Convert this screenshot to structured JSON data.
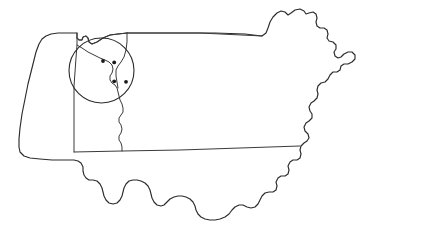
{
  "figure": {
    "name": "massachusetts-county-map-with-study-area",
    "width": 437,
    "height": 246,
    "background_color": "#ffffff",
    "outline_color": "#2b2b2b",
    "county_line_color": "#3a3a3a",
    "marker_color": "#1a1a1a",
    "title": "",
    "caption": "",
    "labels": []
  },
  "map": {
    "region_name": "Massachusetts",
    "projection_note": "simple outline, no graticule",
    "state_outline_path": "M 19 139 L 20 128 L 22 114 L 25 99 L 28 84 L 32 68 L 36 52 L 39 44 L 42 39 L 46 36 L 51 34 L 58 33 L 68 33 L 77 33 L 77 38 L 79 40 L 82 40 L 83 37 L 86 36 L 88 38 L 89 42 L 92 44 L 97 42 L 103 38 L 110 35 L 118 34 L 127 33 L 140 33 L 160 33 L 185 33 L 215 33 L 245 34 L 262 36 L 266 33 L 268 28 L 270 22 L 273 17 L 277 13 L 281 11 L 285 12 L 288 15 L 291 13 L 295 10 L 300 9 L 304 11 L 306 14 L 309 13 L 313 12 L 316 14 L 317 18 L 316 22 L 317 26 L 320 28 L 324 28 L 327 30 L 328 34 L 327 38 L 329 41 L 333 42 L 336 45 L 336 49 L 334 52 L 335 56 L 338 58 L 341 57 L 344 54 L 348 52 L 352 52 L 355 55 L 355 59 L 352 62 L 348 64 L 344 64 L 341 66 L 340 70 L 337 72 L 333 72 L 330 75 L 328 79 L 325 82 L 321 83 L 318 86 L 317 90 L 318 94 L 317 98 L 314 101 L 311 103 L 309 107 L 310 111 L 312 114 L 312 118 L 309 121 L 306 123 L 304 127 L 305 131 L 308 134 L 309 138 L 307 141 L 304 143 L 301 146 L 300 150 L 301 154 L 300 158 L 297 160 L 293 160 L 290 162 L 288 166 L 289 170 L 288 174 L 285 176 L 281 176 L 278 178 L 276 182 L 277 186 L 276 190 L 273 192 L 269 192 L 265 193 L 262 196 L 260 200 L 258 204 L 255 207 L 251 208 L 247 207 L 243 205 L 239 205 L 235 207 L 232 210 L 229 214 L 225 217 L 220 219 L 215 220 L 210 220 L 205 219 L 201 217 L 198 214 L 196 210 L 195 206 L 193 202 L 190 199 L 186 197 L 182 196 L 178 196 L 174 197 L 170 199 L 167 202 L 164 205 L 161 206 L 157 205 L 154 202 L 152 198 L 151 194 L 150 190 L 148 186 L 145 183 L 141 181 L 137 180 L 133 180 L 129 181 L 126 184 L 124 188 L 123 192 L 122 196 L 120 200 L 117 203 L 113 204 L 109 203 L 106 200 L 104 196 L 103 192 L 102 188 L 100 184 L 97 181 L 93 180 L 89 180 L 86 178 L 84 175 L 83 171 L 83 167 L 81 163 L 78 161 L 74 160 L 70 160 L 62 160 L 52 160 L 40 159 L 30 158 L 24 156 L 20 152 L 19 147 Z",
    "county_lines": [
      {
        "name": "berkshire-eastern-boundary",
        "path": "M 77 33 L 77 45 L 76 58 L 75 72 L 74 86 L 74 100 L 74 114 L 74 128 L 74 142 L 74 152"
      },
      {
        "name": "franklin-hampshire-northern-boundary",
        "path": "M 77 38 L 79 40 L 82 40 L 83 37 L 86 36 L 88 38 L 89 42 L 92 44 L 97 42 L 103 38 L 110 35 L 118 34 L 127 33"
      },
      {
        "name": "connecticut-river-valley-boundary",
        "path": "M 77 45 L 82 48 L 88 52 L 94 55 L 100 58 L 105 60 L 109 62 L 112 65 L 113 69 L 112 73 L 110 76 L 110 80 L 112 83 L 115 85 L 117 88 L 118 92 L 119 96 L 120 100 L 122 104 L 123 108 L 123 112 L 121 115 L 119 118 L 119 122 L 121 125 L 122 129 L 121 133 L 119 136 L 119 140 L 121 143 L 122 147 L 122 151"
      },
      {
        "name": "worcester-western-boundary",
        "path": "M 127 33 L 127 42 L 126 50 L 124 57 L 121 62 L 118 66 L 116 70 L 116 76 L 117 82 L 118 88"
      },
      {
        "name": "southern-county-line",
        "path": "M 74 152 L 122 151 L 180 150 L 240 148 L 300 146"
      },
      {
        "name": "northern-state-line-segment",
        "path": "M 127 33 L 200 33 L 262 36"
      }
    ],
    "highlight": {
      "name": "study-area-circle",
      "shape": "circle",
      "cx": 101.5,
      "cy": 70.5,
      "r": 32.5,
      "label": ""
    },
    "markers": [
      {
        "name": "site-1",
        "cx": 103.0,
        "cy": 61.0,
        "r": 1.9,
        "label": ""
      },
      {
        "name": "site-2",
        "cx": 114.2,
        "cy": 62.4,
        "r": 1.9,
        "label": ""
      },
      {
        "name": "site-3",
        "cx": 114.2,
        "cy": 81.3,
        "r": 1.9,
        "label": ""
      },
      {
        "name": "site-4",
        "cx": 126.0,
        "cy": 81.8,
        "r": 1.9,
        "label": ""
      }
    ]
  }
}
